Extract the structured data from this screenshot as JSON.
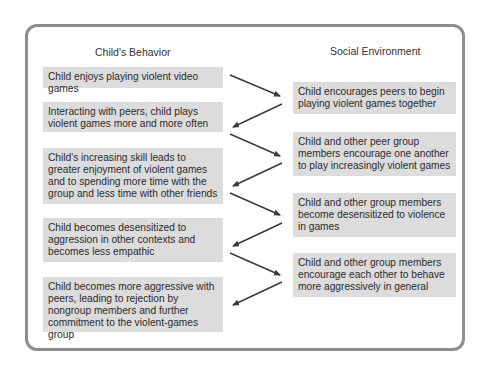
{
  "diagram": {
    "columns": {
      "left_title": "Child's Behavior",
      "right_title": "Social Environment"
    },
    "left_boxes": [
      {
        "text": "Child enjoys playing violent video games"
      },
      {
        "text": "Interacting with peers, child plays violent games more and more often"
      },
      {
        "text": "Child's increasing skill leads to greater enjoyment of violent games and to spending more time with the group and less time with other friends"
      },
      {
        "text": "Child becomes desensitized to aggression in other contexts and becomes less empathic"
      },
      {
        "text": "Child becomes more aggressive with peers, leading to rejection by nongroup members and further commitment to the violent-games group"
      }
    ],
    "right_boxes": [
      {
        "text": "Child encourages peers to begin playing violent games together"
      },
      {
        "text": "Child and other peer group members encourage one another to play increasingly violent games"
      },
      {
        "text": "Child and other group members become desensitized to violence in games"
      },
      {
        "text": "Child and other group members encourage each other to behave more aggressively in general"
      }
    ],
    "colors": {
      "frame_border": "#8e8e8e",
      "box_fill": "#dcdcdc",
      "arrow": "#3a3a3a",
      "text": "#2b2b2b"
    },
    "flow": [
      "L1->R1",
      "R1->L2",
      "L2->R2",
      "R2->L3",
      "L3->R3",
      "R3->L4",
      "L4->R4",
      "R4->L5"
    ]
  }
}
